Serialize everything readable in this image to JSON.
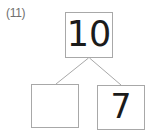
{
  "worksheet": {
    "problem_number": "(11)",
    "background_color": "#ffffff",
    "line_color": "#a8a8a8",
    "text_color": "#1b1b1b",
    "label_color": "#6f6f6f"
  },
  "number_bond": {
    "whole": {
      "label": "whole-box",
      "value": "10",
      "filled": true
    },
    "parts": [
      {
        "label": "part-box-left",
        "value": "",
        "filled": false
      },
      {
        "label": "part-box-right",
        "value": "7",
        "filled": true
      }
    ]
  }
}
